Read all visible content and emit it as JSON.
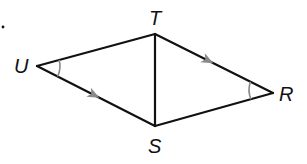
{
  "diagram": {
    "type": "geometry",
    "colors": {
      "line": "#111111",
      "marks": "#8a8a8a",
      "background": "#ffffff"
    },
    "vertices": [
      {
        "name": "U",
        "label": "U",
        "x": 37,
        "y": 66
      },
      {
        "name": "T",
        "label": "T",
        "x": 155,
        "y": 34
      },
      {
        "name": "R",
        "label": "R",
        "x": 273,
        "y": 93
      },
      {
        "name": "S",
        "label": "S",
        "x": 155,
        "y": 126
      }
    ],
    "segments": [
      {
        "from": "U",
        "to": "T"
      },
      {
        "from": "T",
        "to": "R"
      },
      {
        "from": "R",
        "to": "S"
      },
      {
        "from": "S",
        "to": "U"
      },
      {
        "from": "T",
        "to": "S"
      }
    ],
    "angle_marks": [
      {
        "vertex": "U",
        "arcs": 1
      },
      {
        "vertex": "R",
        "arcs": 1
      }
    ],
    "parallel_marks": [
      {
        "segment": "US",
        "arrows": 1
      },
      {
        "segment": "TR",
        "arrows": 1
      }
    ],
    "stray_mark": "."
  }
}
